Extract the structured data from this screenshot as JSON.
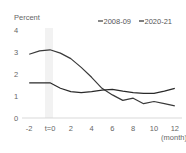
{
  "chart_data": {
    "type": "line",
    "title": "",
    "ylabel": "Percent",
    "xlabel": "(month)",
    "ylim": [
      0,
      4
    ],
    "xlim": [
      -2,
      12
    ],
    "yticks": [
      0,
      1,
      2,
      3,
      4
    ],
    "xticks": [
      -2,
      0,
      2,
      4,
      6,
      8,
      10,
      12
    ],
    "xtick_labels": [
      "-2",
      "t=0",
      "2",
      "4",
      "6",
      "8",
      "10",
      "12"
    ],
    "grid": false,
    "legend_position": "top-right",
    "highlight_band": {
      "x": 0,
      "color": "#f0f0f0"
    },
    "x": [
      -2,
      -1,
      0,
      1,
      2,
      3,
      4,
      5,
      6,
      7,
      8,
      9,
      10,
      11,
      12
    ],
    "series": [
      {
        "name": "2008-09",
        "color": "#3a3a3a",
        "values": [
          2.9,
          3.05,
          3.1,
          2.95,
          2.7,
          2.3,
          1.85,
          1.35,
          1.05,
          0.8,
          0.9,
          0.65,
          0.75,
          0.65,
          0.55
        ]
      },
      {
        "name": "2020-21",
        "color": "#2a2a2a",
        "values": [
          1.6,
          1.6,
          1.6,
          1.35,
          1.2,
          1.15,
          1.2,
          1.27,
          1.3,
          1.22,
          1.15,
          1.12,
          1.12,
          1.22,
          1.35
        ]
      }
    ]
  }
}
